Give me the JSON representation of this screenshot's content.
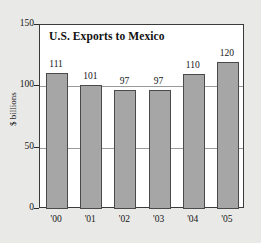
{
  "chart_data": {
    "type": "bar",
    "title": "U.S. Exports to Mexico",
    "xlabel": "",
    "ylabel": "$ billions",
    "categories": [
      "'00",
      "'01",
      "'02",
      "'03",
      "'04",
      "'05"
    ],
    "values": [
      111,
      101,
      97,
      97,
      110,
      120
    ],
    "value_labels": [
      "111",
      "101",
      "97",
      "97",
      "110",
      "120"
    ],
    "ylim": [
      0,
      150
    ],
    "yticks": [
      0,
      50,
      100,
      150
    ],
    "ytick_labels": [
      "0",
      "50",
      "100",
      "150"
    ],
    "gridlines": [
      50,
      100
    ],
    "grid": true,
    "legend": false,
    "colors": {
      "bar_fill": "#a6a6a6",
      "bar_edge": "#4a4a4a",
      "plot_background": "#ffffff",
      "figure_background": "#e9e9e7",
      "frame": "#3a3a3a",
      "gridline": "#9a9a9a",
      "text": "#141414"
    }
  }
}
